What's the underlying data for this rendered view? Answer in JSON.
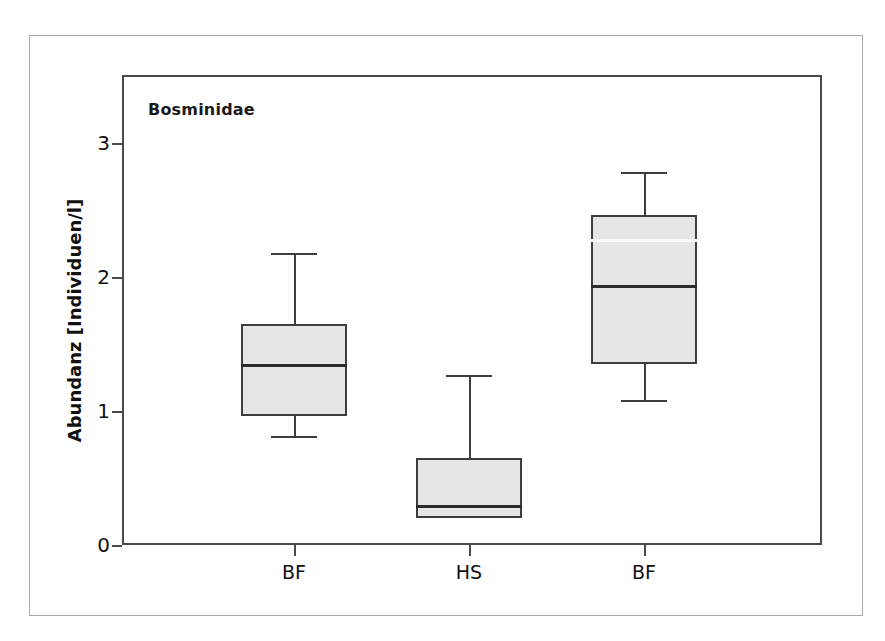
{
  "figure": {
    "panel_title": "Bosminidae"
  },
  "chart_data": {
    "type": "box",
    "title": "Bosminidae",
    "xlabel": "",
    "ylabel": "Abundanz [Individuen/l]",
    "ylim": [
      0,
      3.47
    ],
    "ytick_values": [
      0,
      1,
      2,
      3
    ],
    "ytick_labels": [
      "0",
      "1",
      "2",
      "3"
    ],
    "grid": false,
    "legend": false,
    "categories": [
      "BF",
      "HS",
      "BF"
    ],
    "boxes": [
      {
        "category": "BF",
        "whisker_low": 0.81,
        "q1": 0.96,
        "median": 1.35,
        "q3": 1.65,
        "whisker_high": 2.18,
        "has_low_whisker": true,
        "has_high_whisker": true
      },
      {
        "category": "HS",
        "whisker_low": 0.2,
        "q1": 0.2,
        "median": 0.3,
        "q3": 0.65,
        "whisker_high": 1.27,
        "has_low_whisker": false,
        "has_high_whisker": true
      },
      {
        "category": "BF",
        "whisker_low": 1.08,
        "q1": 1.35,
        "median": 1.94,
        "q3": 2.46,
        "whisker_high": 2.78,
        "has_low_whisker": true,
        "has_high_whisker": true,
        "inner_light_line": 2.28
      }
    ],
    "colors": {
      "box_fill": "#e6e6e6",
      "box_edge": "#3d3d3d",
      "median": "#2b2b2b",
      "axis": "#4a4a4a",
      "text": "#111111",
      "outer_frame": "#a9a9a9"
    }
  }
}
